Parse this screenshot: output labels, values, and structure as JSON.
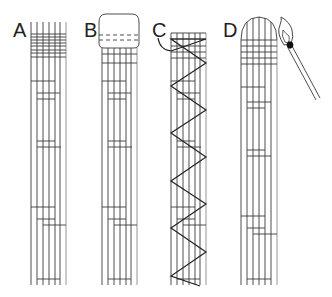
{
  "figure": {
    "panels": [
      {
        "id": "A",
        "label": "A",
        "x": 13,
        "y": 20,
        "description": "strand bundle with wrapped top binding"
      },
      {
        "id": "B",
        "label": "B",
        "x": 84,
        "y": 20,
        "description": "strand bundle with rounded cap and dashed lines"
      },
      {
        "id": "C",
        "label": "C",
        "x": 152,
        "y": 20,
        "description": "strand bundle with zigzag thread"
      },
      {
        "id": "D",
        "label": "D",
        "x": 223,
        "y": 20,
        "description": "strand bundle with arched sealed top and lit match"
      }
    ],
    "colors": {
      "line": "#3a3a3a",
      "light_line": "#8a8a8a",
      "background": "#ffffff",
      "match_head": "#111111"
    }
  }
}
